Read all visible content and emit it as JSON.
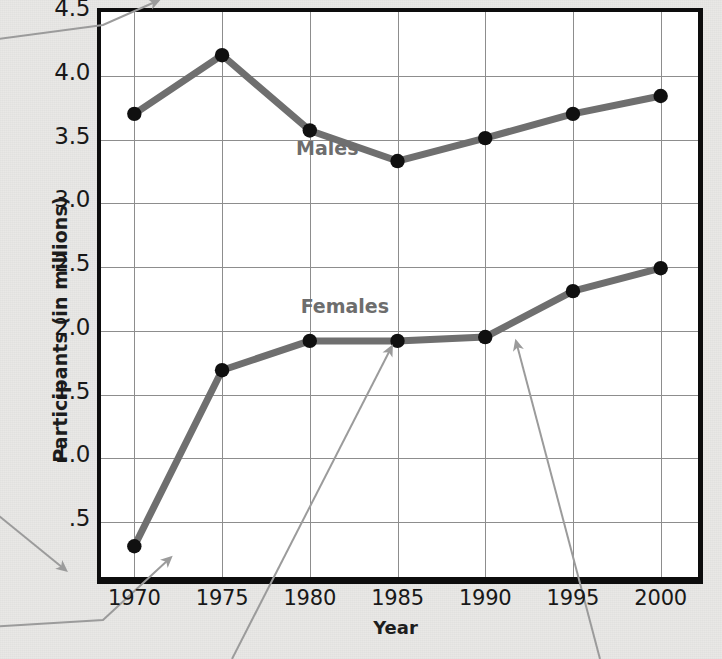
{
  "chart_data": {
    "type": "line",
    "title": "",
    "xlabel": "Year",
    "ylabel": "Participants (in millions)",
    "x": [
      1970,
      1975,
      1980,
      1985,
      1990,
      1995,
      2000
    ],
    "categories": [
      "1970",
      "1975",
      "1980",
      "1985",
      "1990",
      "1995",
      "2000"
    ],
    "xtick_labels": [
      "1970",
      "1975",
      "1980",
      "1985",
      "1990",
      "1995",
      "2000"
    ],
    "ytick_labels": [
      "4.5",
      "4.0",
      "3.5",
      "3.0",
      "2.5",
      "2.0",
      "1.5",
      "1.0",
      ".5"
    ],
    "ytick_values": [
      4.5,
      4.0,
      3.5,
      3.0,
      2.5,
      2.0,
      1.5,
      1.0,
      0.5
    ],
    "ylim": [
      0.07,
      4.5
    ],
    "xlim": [
      1968.1,
      2001.9
    ],
    "grid": true,
    "legend_position": "inline-labels",
    "series": [
      {
        "name": "Males",
        "values": [
          3.67,
          4.13,
          3.54,
          3.3,
          3.48,
          3.67,
          3.81
        ],
        "color": "#6f6f6f",
        "marker_color": "#101010",
        "label_x": 1981.0,
        "label_y": 3.4
      },
      {
        "name": "Females",
        "values": [
          0.28,
          1.66,
          1.89,
          1.89,
          1.92,
          2.28,
          2.46
        ],
        "color": "#6f6f6f",
        "marker_color": "#101010",
        "label_x": 1982.0,
        "label_y": 2.16
      }
    ]
  },
  "annotations": {
    "callout_color": "#9b9b9b",
    "arrows": [
      {
        "name": "callout-arrow-top-border",
        "from_x": -10,
        "from_y": 40,
        "bend_x": 103,
        "bend_y": 25,
        "to_x": 155,
        "to_y": 2
      },
      {
        "name": "callout-arrow-left-axis",
        "from_x": -12,
        "from_y": 507,
        "to_x": 63,
        "to_y": 568
      },
      {
        "name": "callout-arrow-x-axis",
        "from_x": -14,
        "from_y": 627,
        "bend_x": 103,
        "bend_y": 620,
        "to_x": 168,
        "to_y": 560
      },
      {
        "name": "callout-arrow-females-1985",
        "from_x": 232,
        "from_y": 659,
        "to_x": 390,
        "to_y": 350
      },
      {
        "name": "callout-arrow-females-1990-1995",
        "from_x": 600,
        "from_y": 659,
        "to_x": 517,
        "to_y": 345
      }
    ]
  },
  "colors": {
    "page_background": "#e9e8e6",
    "plot_background": "#ffffff",
    "axis": "#0d0d0d",
    "gridline": "#8d8d8d",
    "series_line": "#6f6f6f",
    "marker": "#101010",
    "series_label": "#6d6d6d",
    "tick_label": "#181818",
    "axis_title": "#1d1d1d",
    "callout": "#9b9b9b"
  }
}
